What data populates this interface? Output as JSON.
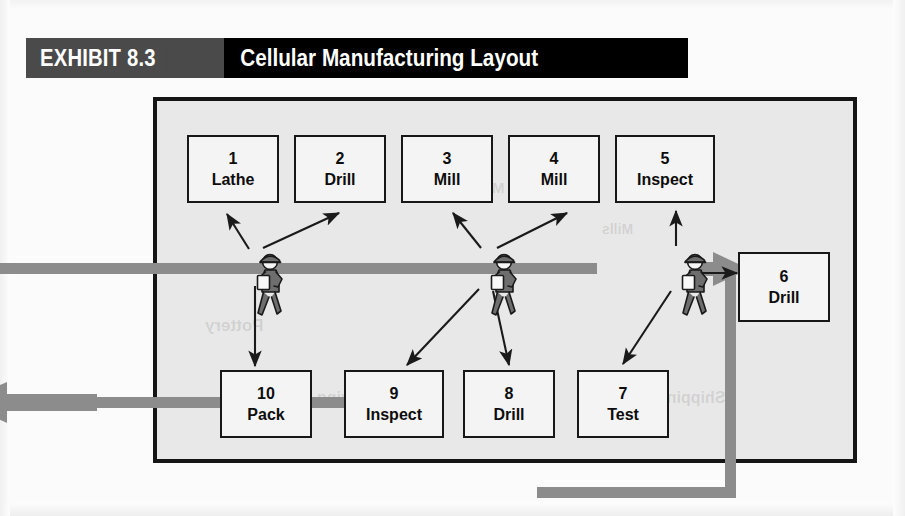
{
  "exhibit": {
    "tag": "EXHIBIT 8.3",
    "title": "Cellular Manufacturing Layout"
  },
  "colors": {
    "title_tag_bg": "#4a4a4a",
    "title_main_bg": "#000000",
    "title_text": "#ffffff",
    "cell_background": "#e8e8e8",
    "cell_border": "#151515",
    "station_fill": "#f4f4f4",
    "station_border": "#171717",
    "flow_line": "#8c8c8c",
    "worker_body": "#6e6e6e",
    "worker_outline": "#1a1a1a",
    "clipboard": "#f8f8f8",
    "arrow": "#1a1a1a",
    "page_background": "#fbfbfb"
  },
  "stations": [
    {
      "id": "station-1",
      "num": "1",
      "name": "Lathe",
      "x": 187,
      "y": 135,
      "w": 92,
      "h": 68
    },
    {
      "id": "station-2",
      "num": "2",
      "name": "Drill",
      "x": 294,
      "y": 135,
      "w": 92,
      "h": 68
    },
    {
      "id": "station-3",
      "num": "3",
      "name": "Mill",
      "x": 401,
      "y": 135,
      "w": 92,
      "h": 68
    },
    {
      "id": "station-4",
      "num": "4",
      "name": "Mill",
      "x": 508,
      "y": 135,
      "w": 92,
      "h": 68
    },
    {
      "id": "station-5",
      "num": "5",
      "name": "Inspect",
      "x": 615,
      "y": 135,
      "w": 100,
      "h": 68
    },
    {
      "id": "station-6",
      "num": "6",
      "name": "Drill",
      "x": 738,
      "y": 252,
      "w": 92,
      "h": 70
    },
    {
      "id": "station-7",
      "num": "7",
      "name": "Test",
      "x": 577,
      "y": 370,
      "w": 92,
      "h": 68
    },
    {
      "id": "station-8",
      "num": "8",
      "name": "Drill",
      "x": 463,
      "y": 370,
      "w": 92,
      "h": 68
    },
    {
      "id": "station-9",
      "num": "9",
      "name": "Inspect",
      "x": 344,
      "y": 370,
      "w": 100,
      "h": 68
    },
    {
      "id": "station-10",
      "num": "10",
      "name": "Pack",
      "x": 220,
      "y": 370,
      "w": 92,
      "h": 68
    }
  ],
  "workers": [
    {
      "id": "worker-1",
      "x": 248,
      "y": 253,
      "serves": [
        "1",
        "2",
        "10"
      ]
    },
    {
      "id": "worker-2",
      "x": 482,
      "y": 253,
      "serves": [
        "3",
        "4",
        "8",
        "9"
      ]
    },
    {
      "id": "worker-3",
      "x": 673,
      "y": 253,
      "serves": [
        "5",
        "6",
        "7"
      ]
    }
  ],
  "flow": {
    "inbound_label": "material-in",
    "outbound_label": "finished-goods-out",
    "direction": "clockwise"
  },
  "ghost_text": [
    {
      "text": "Pottery",
      "x": 48,
      "y": 215,
      "size": 17
    },
    {
      "text": "Shipping",
      "x": 500,
      "y": 288,
      "size": 16
    },
    {
      "text": "Receiving",
      "x": 160,
      "y": 288,
      "size": 16
    },
    {
      "text": "Mixing",
      "x": 300,
      "y": 78,
      "size": 15
    },
    {
      "text": "Mills",
      "x": 445,
      "y": 120,
      "size": 14
    }
  ]
}
